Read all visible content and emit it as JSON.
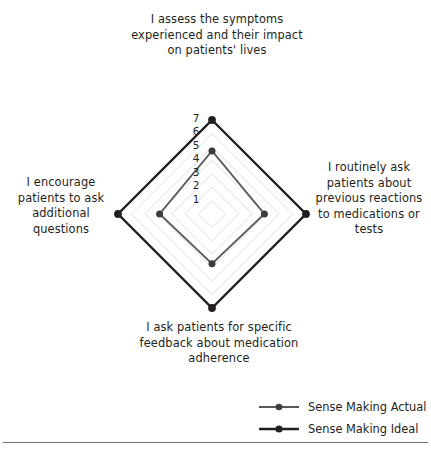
{
  "figure": {
    "title": "",
    "footer_rule": true
  },
  "axes": {
    "top_label": "I assess the symptoms experienced and their impact on patients' lives",
    "right_label": "I routinely ask patients about previous reactions to medications or tests",
    "bottom_label": "I ask patients for specific feedback about medication adherence",
    "left_label": "I encourage patients to ask additional questions"
  },
  "legend": {
    "items": [
      {
        "label": "Sense Making Actual",
        "color": "#58595b",
        "marker": "circle"
      },
      {
        "label": "Sense Making Ideal",
        "color": "#231f20",
        "marker": "circle"
      }
    ]
  },
  "chart_data": {
    "type": "radar",
    "title": "",
    "categories": [
      "I assess the symptoms experienced and their impact on patients' lives",
      "I routinely ask patients about previous reactions to medications or tests",
      "I ask patients for specific feedback about medication adherence",
      "I encourage patients to ask additional questions"
    ],
    "tick_labels": [
      "1",
      "2",
      "3",
      "4",
      "5",
      "6",
      "7"
    ],
    "rmin": 0,
    "rmax": 7,
    "grid": true,
    "grid_shape": "polygon",
    "grid_color": "#d9d9d9",
    "tick_label_color": "#231f20",
    "legend_position": "bottom-right",
    "series": [
      {
        "name": "Sense Making Actual",
        "color": "#58595b",
        "line_width": 1.8,
        "marker": "circle",
        "values": [
          4.7,
          3.9,
          3.7,
          3.9
        ]
      },
      {
        "name": "Sense Making Ideal",
        "color": "#231f20",
        "line_width": 2.4,
        "marker": "circle",
        "values": [
          7,
          7,
          7,
          7
        ]
      }
    ]
  },
  "geometry": {
    "center_x": 212,
    "center_y": 214,
    "radius": 94,
    "tick_label_x": 196,
    "tick_label_offset_y": -2
  }
}
